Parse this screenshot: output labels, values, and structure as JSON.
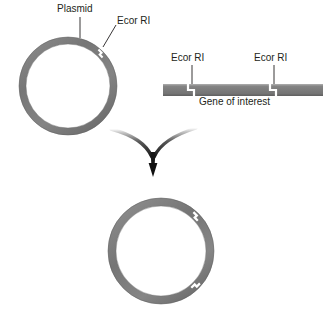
{
  "figure": {
    "colors": {
      "dna_fill": "#7b7b7b",
      "dna_fill_light": "#9a9a9a",
      "dna_edge": "#5e5e5e",
      "text": "#231f20",
      "leader_line": "#231f20",
      "arrow": "#1a1a1a",
      "background": "#ffffff"
    }
  },
  "labels": {
    "plasmid": "Plasmid",
    "ecor_ri_plasmid": "Ecor RI",
    "ecor_ri_gene_left": "Ecor RI",
    "ecor_ri_gene_right": "Ecor RI",
    "gene_of_interest": "Gene of interest"
  },
  "elements": {
    "top_plasmid": {
      "name": "plasmid-ring-top",
      "center_x": 68,
      "center_y": 86,
      "outer_radius": 49,
      "ring_thickness": 7,
      "cut_sites": 1,
      "cut_site_angle_deg": 45
    },
    "gene_fragment": {
      "name": "linear-dna-bar",
      "left": 163,
      "right": 323,
      "top": 84,
      "height": 12,
      "cut_positions_x": [
        191,
        273
      ]
    },
    "arrow": {
      "name": "converging-arrow",
      "left_branch_start_x": 110,
      "right_branch_start_x": 196,
      "branch_start_y": 128,
      "junction_x": 152,
      "junction_y": 155,
      "tip_y": 176
    },
    "bottom_plasmid": {
      "name": "plasmid-ring-bottom",
      "center_x": 161,
      "center_y": 251,
      "outer_radius": 53,
      "ring_thickness": 8,
      "cut_sites": 2,
      "cut_site_angles_deg": [
        45,
        315
      ]
    }
  }
}
